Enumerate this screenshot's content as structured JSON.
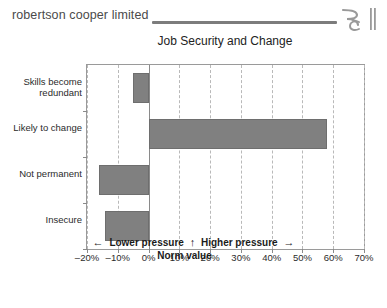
{
  "header": {
    "brand": "robertson cooper limited",
    "logo_name": "rc-monogram-logo",
    "rule_color": "#7c7c7c"
  },
  "chart_data": {
    "type": "bar",
    "orientation": "horizontal",
    "title": "Job Security and Change",
    "categories": [
      "Skills become redundant",
      "Likely to change",
      "Not permanent",
      "Insecure"
    ],
    "values": [
      -5,
      58,
      -16,
      -14
    ],
    "xlabel": "",
    "ylabel": "",
    "xlim": [
      -20,
      70
    ],
    "xticks": [
      -20,
      -10,
      0,
      10,
      20,
      30,
      40,
      50,
      60,
      70
    ],
    "xtick_labels": [
      "-20%",
      "-10%",
      "0%",
      "10%",
      "20%",
      "30%",
      "40%",
      "50%",
      "60%",
      "70%"
    ],
    "grid": true,
    "legend": "none",
    "bar_color": "#808080",
    "zero_line_color": "#8a8a8a",
    "gridline_color": "#b9b9b9"
  },
  "caption": {
    "left_arrow": "←",
    "lower": "Lower pressure",
    "up_arrow": "↑",
    "higher": "Higher pressure",
    "right_arrow": "→",
    "norm": "Norm value"
  }
}
